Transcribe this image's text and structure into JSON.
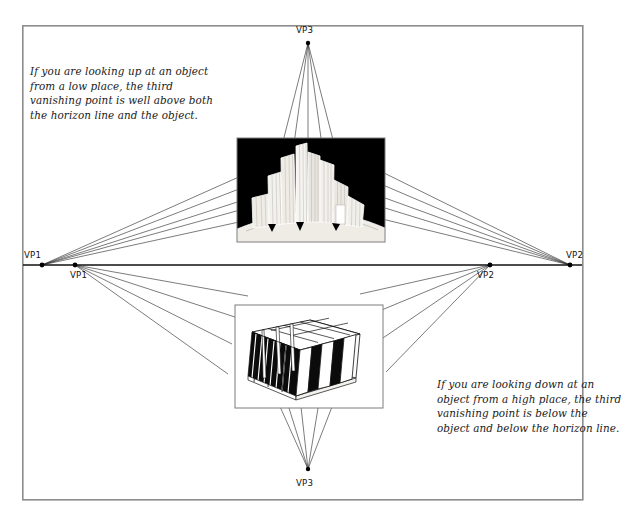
{
  "figure": {
    "background_color": "#ffffff",
    "frame": {
      "name": "outer-border",
      "x": 22,
      "y": 25,
      "width": 561,
      "height": 475,
      "stroke": "#8c8c8c",
      "stroke_width": 1.6
    },
    "horizon": {
      "label": "horizon-line",
      "y": 265,
      "x_start": 23,
      "x_end": 582,
      "stroke": "#111111",
      "stroke_width": 1.4
    }
  },
  "captions": {
    "looking_up": "If you are looking up at an object from a low place, the third vanishing point is well above both the horizon line and the object.",
    "looking_down": "If you are looking down at an object from a high place, the third vanishing point is below the object and below the horizon line."
  },
  "vanishing_points": [
    {
      "id": "vp1-upper",
      "label": "VP1",
      "x": 42,
      "y": 265,
      "label_x": 70,
      "label_y": 251,
      "belongs_to": "upper-scene"
    },
    {
      "id": "vp2-upper",
      "label": "VP2",
      "x": 570,
      "y": 265,
      "label_x": 566,
      "label_y": 251,
      "belongs_to": "upper-scene"
    },
    {
      "id": "vp3-upper",
      "label": "VP3",
      "x": 308,
      "y": 42,
      "label_x": 297,
      "label_y": 26,
      "belongs_to": "upper-scene"
    },
    {
      "id": "vp1-lower",
      "label": "VP1",
      "x": 75,
      "y": 265,
      "label_x": 71,
      "label_y": 272,
      "belongs_to": "lower-scene"
    },
    {
      "id": "vp2-lower",
      "label": "VP2",
      "x": 490,
      "y": 265,
      "label_x": 478,
      "label_y": 272,
      "belongs_to": "lower-scene"
    },
    {
      "id": "vp3-lower",
      "label": "VP3",
      "x": 308,
      "y": 470,
      "label_x": 297,
      "label_y": 481,
      "belongs_to": "lower-scene"
    }
  ],
  "illustrations": [
    {
      "id": "skyscrapers-worms-eye",
      "description": "Cluster of tall buildings seen from below against a black sky",
      "x": 237,
      "y": 138,
      "width": 148,
      "height": 104,
      "sky_color": "#000000",
      "building_color": "#f2f0ec",
      "outline_color": "#ffffff"
    },
    {
      "id": "blocks-birds-eye",
      "description": "Grid of rectangular slabs seen from above",
      "x": 235,
      "y": 305,
      "width": 148,
      "height": 103,
      "panel_color": "#ffffff",
      "shadow_color": "#0a0a0a",
      "outline_color": "#111111"
    }
  ],
  "perspective_lines": {
    "stroke": "#2a2a2a",
    "stroke_width": 0.65,
    "upper_from_vp1_count": 5,
    "upper_from_vp2_count": 5,
    "upper_from_vp3_count": 5,
    "lower_from_vp1_count": 4,
    "lower_from_vp2_count": 4,
    "lower_from_vp3_count": 5
  }
}
